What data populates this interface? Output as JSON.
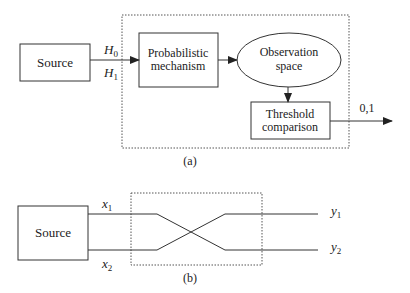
{
  "diagram_a": {
    "caption": "(a)",
    "source_label": "Source",
    "hypothesis_top": "H",
    "hypothesis_top_sub": "0",
    "hypothesis_bottom": "H",
    "hypothesis_bottom_sub": "1",
    "prob_line1": "Probabilistic",
    "prob_line2": "mechanism",
    "obs_line1": "Observation",
    "obs_line2": "space",
    "thresh_line1": "Threshold",
    "thresh_line2": "comparison",
    "output_label": "0,1"
  },
  "diagram_b": {
    "caption": "(b)",
    "source_label": "Source",
    "input_top": "x",
    "input_top_sub": "1",
    "input_bottom": "x",
    "input_bottom_sub": "2",
    "output_top": "y",
    "output_top_sub": "1",
    "output_bottom": "y",
    "output_bottom_sub": "2"
  },
  "colors": {
    "stroke": "#333333",
    "background": "#ffffff"
  }
}
